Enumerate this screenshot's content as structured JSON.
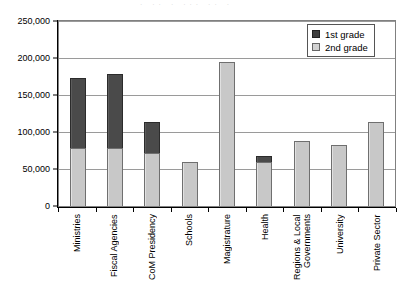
{
  "top_clip_text": "· ·· ·  ···      ·· ·",
  "legend": {
    "position": "top-right",
    "entries": [
      {
        "label": "1st grade",
        "color": "#4a4a4a",
        "swatch": "first-grade-swatch"
      },
      {
        "label": "2nd grade",
        "color": "#c8c8c8",
        "swatch": "second-grade-swatch"
      }
    ]
  },
  "chart_data": {
    "type": "bar",
    "subtype": "stacked-column",
    "title": "",
    "subtitle": "",
    "xlabel": "",
    "ylabel": "",
    "ylim": [
      0,
      250000
    ],
    "ytick_step": 50000,
    "grid": true,
    "ytick_labels": [
      "250,000",
      "200,000",
      "150,000",
      "100,000",
      "50,000",
      "0"
    ],
    "ytick_values": [
      250000,
      200000,
      150000,
      100000,
      50000,
      0
    ],
    "categories": [
      "Ministries",
      "Fiscal Agencies",
      "CoM Presidency",
      "Schools",
      "Magistrature",
      "Health",
      "Regions & Local Governments",
      "University",
      "Private Sector"
    ],
    "series": [
      {
        "name": "2nd grade",
        "color": "#c8c8c8",
        "values": [
          78000,
          78000,
          72000,
          59000,
          194000,
          59000,
          88000,
          83000,
          114000
        ]
      },
      {
        "name": "1st grade",
        "color": "#4a4a4a",
        "values": [
          95000,
          100000,
          41000,
          0,
          0,
          9000,
          0,
          0,
          0
        ]
      }
    ],
    "totals": [
      173000,
      178000,
      113000,
      59000,
      194000,
      68000,
      88000,
      83000,
      114000
    ]
  }
}
